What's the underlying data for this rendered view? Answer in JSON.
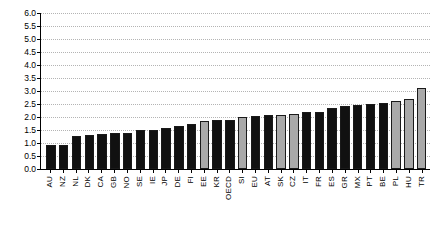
{
  "chart_data": {
    "type": "bar",
    "title": "",
    "subtitle": "",
    "xlabel": "",
    "ylabel": "",
    "ylim": [
      0.0,
      6.0
    ],
    "ytick_step": 0.5,
    "grid": true,
    "legend": "none",
    "orientation": "vertical",
    "sorted": "ascending",
    "categories": [
      "AU",
      "NZ",
      "NL",
      "DK",
      "CA",
      "GB",
      "NO",
      "SE",
      "IE",
      "JP",
      "DE",
      "FI",
      "EE",
      "KR",
      "OECD",
      "SI",
      "EU",
      "AT",
      "SK",
      "CZ",
      "IT",
      "FR",
      "ES",
      "GR",
      "MX",
      "PT",
      "BE",
      "PL",
      "HU",
      "TR"
    ],
    "values": [
      0.93,
      0.93,
      1.28,
      1.31,
      1.35,
      1.39,
      1.39,
      1.48,
      1.51,
      1.56,
      1.63,
      1.73,
      1.82,
      1.89,
      1.89,
      1.97,
      2.01,
      2.05,
      2.08,
      2.11,
      2.16,
      2.19,
      2.35,
      2.39,
      2.44,
      2.49,
      2.54,
      2.6,
      2.68,
      3.08
    ],
    "bar_styles": [
      "dark",
      "dark",
      "dark",
      "dark",
      "dark",
      "dark",
      "dark",
      "dark",
      "dark",
      "dark",
      "dark",
      "dark",
      "light",
      "dark",
      "dark",
      "light",
      "dark",
      "dark",
      "light",
      "light",
      "dark",
      "dark",
      "dark",
      "dark",
      "dark",
      "dark",
      "dark",
      "light",
      "light",
      "light"
    ],
    "ytick_labels": [
      "6.0",
      "5.5",
      "5.0",
      "4.5",
      "4.0",
      "3.5",
      "3.0",
      "2.5",
      "2.0",
      "1.5",
      "1.0",
      "0.5",
      "0.0"
    ],
    "ytick_values": [
      6.0,
      5.5,
      5.0,
      4.5,
      4.0,
      3.5,
      3.0,
      2.5,
      2.0,
      1.5,
      1.0,
      0.5,
      0.0
    ],
    "colors": {
      "bar_dark": "#111111",
      "bar_light": "#a9a9a9",
      "bar_outline": "#1a1a1a",
      "axis": "#000000",
      "gridline": "#b4b4b4",
      "background": "#ffffff"
    }
  }
}
